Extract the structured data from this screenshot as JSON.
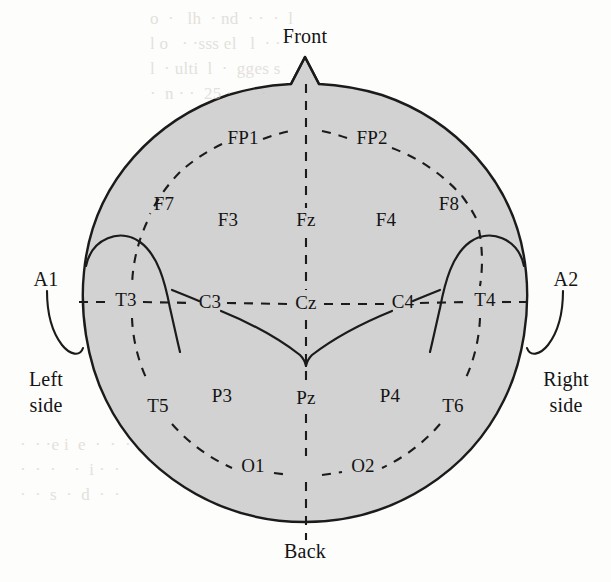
{
  "figure": {
    "kind": "eeg-10-20-electrode-placement-diagram",
    "colors": {
      "scalp_fill": "#d2d2d2",
      "outline": "#1b1b1b",
      "dash": "#1b1b1b",
      "label_text": "#141414",
      "background": "#fdfdfc"
    }
  },
  "orientation": {
    "front": "Front",
    "back": "Back",
    "left": "Left\nside",
    "left_line1": "Left",
    "left_line2": "side",
    "right_line1": "Right",
    "right_line2": "side"
  },
  "reference_electrodes": [
    {
      "id": "A1",
      "label": "A1",
      "side": "left",
      "type": "ear-reference"
    },
    {
      "id": "A2",
      "label": "A2",
      "side": "right",
      "type": "ear-reference"
    }
  ],
  "electrodes": [
    {
      "id": "FP1",
      "label": "FP1",
      "region": "pre-frontal",
      "hemisphere": "left",
      "x": 243,
      "y": 140
    },
    {
      "id": "FP2",
      "label": "FP2",
      "region": "pre-frontal",
      "hemisphere": "right",
      "x": 372,
      "y": 140
    },
    {
      "id": "F7",
      "label": "F7",
      "region": "frontal",
      "hemisphere": "left",
      "x": 164,
      "y": 206
    },
    {
      "id": "F3",
      "label": "F3",
      "region": "frontal",
      "hemisphere": "left",
      "x": 228,
      "y": 222
    },
    {
      "id": "Fz",
      "label": "Fz",
      "region": "frontal",
      "hemisphere": "midline",
      "x": 306,
      "y": 222
    },
    {
      "id": "F4",
      "label": "F4",
      "region": "frontal",
      "hemisphere": "right",
      "x": 386,
      "y": 222
    },
    {
      "id": "F8",
      "label": "F8",
      "region": "frontal",
      "hemisphere": "right",
      "x": 449,
      "y": 206
    },
    {
      "id": "T3",
      "label": "T3",
      "region": "temporal",
      "hemisphere": "left",
      "x": 126,
      "y": 302
    },
    {
      "id": "C3",
      "label": "C3",
      "region": "central",
      "hemisphere": "left",
      "x": 210,
      "y": 304
    },
    {
      "id": "Cz",
      "label": "Cz",
      "region": "central",
      "hemisphere": "midline",
      "x": 306,
      "y": 304
    },
    {
      "id": "C4",
      "label": "C4",
      "region": "central",
      "hemisphere": "right",
      "x": 403,
      "y": 304
    },
    {
      "id": "T4",
      "label": "T4",
      "region": "temporal",
      "hemisphere": "right",
      "x": 485,
      "y": 302
    },
    {
      "id": "T5",
      "label": "T5",
      "region": "temporal",
      "hemisphere": "left",
      "x": 158,
      "y": 408
    },
    {
      "id": "P3",
      "label": "P3",
      "region": "parietal",
      "hemisphere": "left",
      "x": 222,
      "y": 398
    },
    {
      "id": "Pz",
      "label": "Pz",
      "region": "parietal",
      "hemisphere": "midline",
      "x": 306,
      "y": 400
    },
    {
      "id": "P4",
      "label": "P4",
      "region": "parietal",
      "hemisphere": "right",
      "x": 390,
      "y": 398
    },
    {
      "id": "T6",
      "label": "T6",
      "region": "temporal",
      "hemisphere": "right",
      "x": 453,
      "y": 408
    },
    {
      "id": "O1",
      "label": "O1",
      "region": "occipital",
      "hemisphere": "left",
      "x": 253,
      "y": 468
    },
    {
      "id": "O2",
      "label": "O2",
      "region": "occipital",
      "hemisphere": "right",
      "x": 363,
      "y": 468
    }
  ],
  "icons": {
    "nose": "nose-marker",
    "ear_left": "ear-pinna-left",
    "ear_right": "ear-pinna-right",
    "earlobe_left": "earlobe-a1",
    "earlobe_right": "earlobe-a2",
    "central_sulcus": "central-sulcus-curve"
  },
  "background_bleed": {
    "top": "o  ·   lh  · nd  · ·  ·  l\nl o   · ·sss el   l  · ·\nl  · ulti  l  ·  gges s\n·  n · ·  25 ·  ·   ·",
    "bottom": "·  · ·e i  e  ·  ·  ·\n·  ·  ·    ·  i ·  ·\n·  ·  s  ·  d  ·  ·"
  }
}
